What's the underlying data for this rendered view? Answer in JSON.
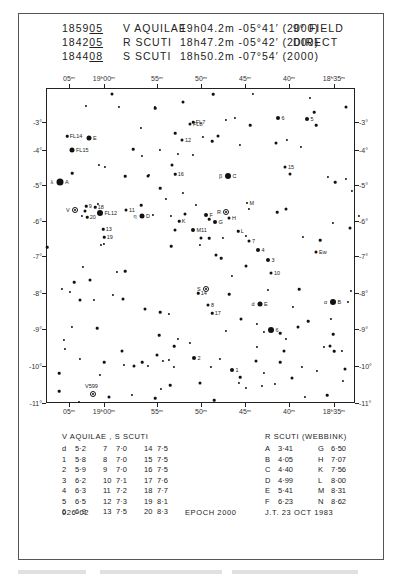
{
  "header": {
    "rows": [
      {
        "code_prefix": "1859",
        "code_suffix": "05",
        "star": "V AQUILAE",
        "ra": "19h04.2m",
        "dec": "-05°41′",
        "epoch": "(2000)",
        "note": "9° FIELD"
      },
      {
        "code_prefix": "1842",
        "code_suffix": "05",
        "star": "R SCUTI",
        "ra": "18h47.2m",
        "dec": "-05°42′",
        "epoch": "(2000)",
        "note": "DIRECT"
      },
      {
        "code_prefix": "1844",
        "code_suffix": "08",
        "star": "S SCUTI",
        "ra": "18h50.2m",
        "dec": "-07°54′",
        "epoch": "(2000)",
        "note": ""
      }
    ]
  },
  "axes": {
    "ra_ticks": [
      {
        "label": "05ᵐ",
        "x": 69
      },
      {
        "label": "19ʰ00ᵐ",
        "x": 104
      },
      {
        "label": "55ᵐ",
        "x": 157
      },
      {
        "label": "50ᵐ",
        "x": 201
      },
      {
        "label": "45ᵐ",
        "x": 245
      },
      {
        "label": "40ᵐ",
        "x": 289
      },
      {
        "label": "18ʰ35ᵐ",
        "x": 334
      }
    ],
    "dec_ticks": [
      {
        "label": "-3°",
        "y": 122
      },
      {
        "label": "-4°",
        "y": 150
      },
      {
        "label": "-5°",
        "y": 185
      },
      {
        "label": "-6°",
        "y": 221
      },
      {
        "label": "-7°",
        "y": 256
      },
      {
        "label": "-8°",
        "y": 293
      },
      {
        "label": "-9°",
        "y": 329
      },
      {
        "label": "-10°",
        "y": 366
      },
      {
        "label": "-11°",
        "y": 403
      }
    ]
  },
  "chart_data": {
    "type": "scatter",
    "xlabel": "Right Ascension",
    "ylabel": "Declination",
    "x_ticks": [
      "05m",
      "19h00m",
      "55m",
      "50m",
      "45m",
      "40m",
      "18h35m"
    ],
    "y_ticks": [
      "-3°",
      "-4°",
      "-5°",
      "-6°",
      "-7°",
      "-8°",
      "-9°",
      "-10°",
      "-11°"
    ],
    "variables": [
      {
        "name": "V Aquilae",
        "label": "V",
        "x": 75,
        "y": 210
      },
      {
        "name": "R Scuti",
        "label": "R",
        "x": 226,
        "y": 212
      },
      {
        "name": "S Scuti",
        "label": "S",
        "x": 206,
        "y": 289
      },
      {
        "name": "V599",
        "label": "V599",
        "x": 93,
        "y": 394
      }
    ],
    "labeled_stars": [
      {
        "label": "A",
        "prefix": "λ",
        "x": 60,
        "y": 182,
        "size": 7
      },
      {
        "label": "B",
        "prefix": "α",
        "x": 333,
        "y": 302,
        "size": 6
      },
      {
        "label": "C",
        "prefix": "β",
        "x": 228,
        "y": 176,
        "size": 6
      },
      {
        "label": "D",
        "prefix": "η",
        "x": 142,
        "y": 216,
        "size": 5
      },
      {
        "label": "E",
        "prefix": "d",
        "x": 260,
        "y": 304,
        "size": 5
      },
      {
        "label": "E",
        "x": 89,
        "y": 138,
        "size": 5
      },
      {
        "label": "F",
        "x": 206,
        "y": 215,
        "size": 4
      },
      {
        "label": "G",
        "x": 215,
        "y": 222,
        "size": 4
      },
      {
        "label": "H",
        "x": 229,
        "y": 218,
        "size": 3
      },
      {
        "label": "K",
        "x": 179,
        "y": 221,
        "size": 2.5
      },
      {
        "label": "L",
        "x": 238,
        "y": 231,
        "size": 2.5
      },
      {
        "label": "M",
        "x": 247,
        "y": 203,
        "size": 2
      },
      {
        "label": "FL15",
        "x": 72,
        "y": 150,
        "size": 5
      },
      {
        "label": "FL12",
        "x": 100,
        "y": 213,
        "size": 6
      },
      {
        "label": "FL8",
        "x": 190,
        "y": 124,
        "size": 3
      },
      {
        "label": "FL7",
        "x": 193,
        "y": 122,
        "size": 2.5
      },
      {
        "label": "FL14",
        "x": 67,
        "y": 136,
        "size": 2.5
      },
      {
        "label": "M11",
        "x": 193,
        "y": 230,
        "size": 4
      },
      {
        "label": "1",
        "x": 232,
        "y": 370,
        "size": 4
      },
      {
        "label": "2",
        "x": 194,
        "y": 358,
        "size": 4
      },
      {
        "label": "3",
        "x": 268,
        "y": 260,
        "size": 4
      },
      {
        "label": "4",
        "x": 258,
        "y": 250,
        "size": 4
      },
      {
        "label": "5",
        "x": 307,
        "y": 119,
        "size": 4
      },
      {
        "label": "6",
        "x": 278,
        "y": 118,
        "size": 4
      },
      {
        "label": "6",
        "x": 271,
        "y": 330,
        "size": 6
      },
      {
        "label": "7",
        "x": 249,
        "y": 241,
        "size": 3
      },
      {
        "label": "8",
        "x": 208,
        "y": 305,
        "size": 3
      },
      {
        "label": "9",
        "x": 86,
        "y": 206,
        "size": 2.5
      },
      {
        "label": "10",
        "x": 271,
        "y": 273,
        "size": 3
      },
      {
        "label": "11",
        "x": 126,
        "y": 210,
        "size": 3
      },
      {
        "label": "12",
        "x": 182,
        "y": 140,
        "size": 3
      },
      {
        "label": "13",
        "x": 103,
        "y": 229,
        "size": 2.5
      },
      {
        "label": "14",
        "x": 198,
        "y": 293,
        "size": 2.5
      },
      {
        "label": "15",
        "x": 285,
        "y": 167,
        "size": 3
      },
      {
        "label": "16",
        "x": 175,
        "y": 174,
        "size": 2.5
      },
      {
        "label": "17",
        "x": 212,
        "y": 313,
        "size": 2.5
      },
      {
        "label": "18",
        "x": 95,
        "y": 207,
        "size": 2.5
      },
      {
        "label": "19",
        "x": 104,
        "y": 237,
        "size": 2.5
      },
      {
        "label": "20",
        "x": 87,
        "y": 217,
        "size": 2.5
      },
      {
        "label": "Ew",
        "x": 316,
        "y": 252,
        "size": 3
      }
    ]
  },
  "field_stars": [
    [
      112,
      94
    ],
    [
      86,
      106
    ],
    [
      119,
      107
    ],
    [
      155,
      108
    ],
    [
      155,
      107
    ],
    [
      183,
      102
    ],
    [
      213,
      94
    ],
    [
      253,
      94
    ],
    [
      310,
      98
    ],
    [
      314,
      112
    ],
    [
      346,
      107
    ],
    [
      141,
      128
    ],
    [
      133,
      149
    ],
    [
      142,
      156
    ],
    [
      160,
      150
    ],
    [
      172,
      165
    ],
    [
      178,
      154
    ],
    [
      193,
      155
    ],
    [
      175,
      133
    ],
    [
      203,
      137
    ],
    [
      218,
      136
    ],
    [
      212,
      141
    ],
    [
      226,
      120
    ],
    [
      235,
      118
    ],
    [
      250,
      125
    ],
    [
      276,
      143
    ],
    [
      240,
      145
    ],
    [
      316,
      125
    ],
    [
      287,
      140
    ],
    [
      301,
      147
    ],
    [
      290,
      174
    ],
    [
      328,
      177
    ],
    [
      346,
      179
    ],
    [
      335,
      182
    ],
    [
      352,
      191
    ],
    [
      350,
      228
    ],
    [
      72,
      173
    ],
    [
      105,
      167
    ],
    [
      99,
      165
    ],
    [
      125,
      176
    ],
    [
      148,
      176
    ],
    [
      149,
      175
    ],
    [
      160,
      188
    ],
    [
      166,
      199
    ],
    [
      171,
      216
    ],
    [
      185,
      214
    ],
    [
      183,
      193
    ],
    [
      196,
      205
    ],
    [
      209,
      219
    ],
    [
      223,
      238
    ],
    [
      201,
      238
    ],
    [
      209,
      238
    ],
    [
      246,
      236
    ],
    [
      249,
      209
    ],
    [
      277,
      212
    ],
    [
      286,
      209
    ],
    [
      303,
      237
    ],
    [
      320,
      240
    ],
    [
      333,
      223
    ],
    [
      359,
      216
    ],
    [
      85,
      211
    ],
    [
      82,
      216
    ],
    [
      98,
      204
    ],
    [
      141,
      205
    ],
    [
      153,
      215
    ],
    [
      175,
      230
    ],
    [
      171,
      246
    ],
    [
      104,
      244
    ],
    [
      101,
      245
    ],
    [
      47,
      247
    ],
    [
      90,
      280
    ],
    [
      83,
      267
    ],
    [
      74,
      282
    ],
    [
      62,
      289
    ],
    [
      70,
      292
    ],
    [
      80,
      300
    ],
    [
      94,
      300
    ],
    [
      117,
      272
    ],
    [
      125,
      271
    ],
    [
      113,
      295
    ],
    [
      123,
      299
    ],
    [
      97,
      328
    ],
    [
      72,
      327
    ],
    [
      64,
      340
    ],
    [
      160,
      312
    ],
    [
      145,
      309
    ],
    [
      169,
      314
    ],
    [
      159,
      335
    ],
    [
      178,
      339
    ],
    [
      163,
      361
    ],
    [
      157,
      355
    ],
    [
      169,
      360
    ],
    [
      190,
      343
    ],
    [
      174,
      346
    ],
    [
      174,
      367
    ],
    [
      216,
      255
    ],
    [
      221,
      258
    ],
    [
      200,
      245
    ],
    [
      232,
      276
    ],
    [
      229,
      294
    ],
    [
      246,
      266
    ],
    [
      268,
      290
    ],
    [
      299,
      289
    ],
    [
      293,
      307
    ],
    [
      351,
      291
    ],
    [
      241,
      319
    ],
    [
      257,
      324
    ],
    [
      264,
      332
    ],
    [
      280,
      333
    ],
    [
      286,
      339
    ],
    [
      298,
      327
    ],
    [
      308,
      321
    ],
    [
      331,
      319
    ],
    [
      348,
      302
    ],
    [
      333,
      334
    ],
    [
      330,
      346
    ],
    [
      324,
      347
    ],
    [
      334,
      351
    ],
    [
      220,
      359
    ],
    [
      226,
      331
    ],
    [
      256,
      361
    ],
    [
      257,
      347
    ],
    [
      264,
      373
    ],
    [
      240,
      377
    ],
    [
      275,
      384
    ],
    [
      292,
      378
    ],
    [
      280,
      362
    ],
    [
      302,
      367
    ],
    [
      317,
      371
    ],
    [
      327,
      395
    ],
    [
      345,
      369
    ],
    [
      343,
      381
    ],
    [
      59,
      373
    ],
    [
      65,
      349
    ],
    [
      80,
      359
    ],
    [
      122,
      351
    ],
    [
      124,
      365
    ],
    [
      100,
      375
    ],
    [
      104,
      362
    ],
    [
      132,
      395
    ],
    [
      134,
      366
    ],
    [
      142,
      362
    ],
    [
      148,
      366
    ],
    [
      161,
      389
    ],
    [
      170,
      385
    ],
    [
      200,
      383
    ],
    [
      211,
      367
    ],
    [
      214,
      400
    ],
    [
      239,
      383
    ],
    [
      262,
      386
    ],
    [
      284,
      351
    ],
    [
      305,
      397
    ],
    [
      342,
      351
    ],
    [
      59,
      391
    ],
    [
      79,
      402
    ],
    [
      109,
      397
    ],
    [
      155,
      398
    ],
    [
      246,
      388
    ]
  ],
  "tables": {
    "left": {
      "title": "V AQUILAE , S SCUTI",
      "columns": [
        [
          {
            "id": "d",
            "mag": "5·2"
          },
          {
            "id": "1",
            "mag": "5·8"
          },
          {
            "id": "2",
            "mag": "5·9"
          },
          {
            "id": "3",
            "mag": "6·2"
          },
          {
            "id": "4",
            "mag": "6·3"
          },
          {
            "id": "5",
            "mag": "6·5"
          },
          {
            "id": "6",
            "mag": "6·9"
          }
        ],
        [
          {
            "id": "7",
            "mag": "7·0"
          },
          {
            "id": "8",
            "mag": "7·0"
          },
          {
            "id": "9",
            "mag": "7·0"
          },
          {
            "id": "10",
            "mag": "7·1"
          },
          {
            "id": "11",
            "mag": "7·2"
          },
          {
            "id": "12",
            "mag": "7·3"
          },
          {
            "id": "13",
            "mag": "7·5"
          }
        ],
        [
          {
            "id": "14",
            "mag": "7·5"
          },
          {
            "id": "15",
            "mag": "7·5"
          },
          {
            "id": "16",
            "mag": "7·5"
          },
          {
            "id": "17",
            "mag": "7·6"
          },
          {
            "id": "18",
            "mag": "7·7"
          },
          {
            "id": "19",
            "mag": "8·1"
          },
          {
            "id": "20",
            "mag": "8·3"
          }
        ]
      ]
    },
    "right": {
      "title": "R SCUTI (WEBBINK)",
      "columns": [
        [
          {
            "id": "A",
            "mag": "3·41"
          },
          {
            "id": "B",
            "mag": "4·05"
          },
          {
            "id": "C",
            "mag": "4·40"
          },
          {
            "id": "D",
            "mag": "4·99"
          },
          {
            "id": "E",
            "mag": "5·41"
          },
          {
            "id": "F",
            "mag": "6·23"
          }
        ],
        [
          {
            "id": "G",
            "mag": "6·50"
          },
          {
            "id": "H",
            "mag": "7·07"
          },
          {
            "id": "K",
            "mag": "7·56"
          },
          {
            "id": "L",
            "mag": "8·00"
          },
          {
            "id": "M",
            "mag": "8·31"
          },
          {
            "id": "N",
            "mag": "8·62"
          }
        ]
      ]
    }
  },
  "footer": {
    "chart_id": "026·02",
    "epoch": "EPOCH 2000",
    "author_date": "J.T.   23 OCT 1983"
  }
}
